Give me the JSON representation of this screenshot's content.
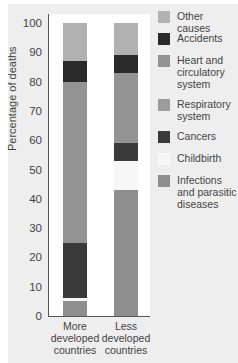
{
  "chart_data": {
    "type": "bar",
    "stacked": true,
    "title": "",
    "ylabel": "Percentage of deaths",
    "xlabel": "",
    "ylim": [
      0,
      100
    ],
    "yticks": [
      0,
      10,
      20,
      30,
      40,
      50,
      60,
      70,
      80,
      90,
      100
    ],
    "categories": [
      "More developed countries",
      "Less developed countries"
    ],
    "category_lines": [
      [
        "More",
        "developed",
        "countries"
      ],
      [
        "Less",
        "developed",
        "countries"
      ]
    ],
    "series": [
      {
        "name": "Infections and parasitic diseases",
        "color": "#8e8e8e",
        "values": [
          5,
          43
        ]
      },
      {
        "name": "Childbirth",
        "color": "#f7f7f7",
        "values": [
          1,
          10
        ]
      },
      {
        "name": "Cancers",
        "color": "#3a3a3a",
        "values": [
          19,
          6
        ]
      },
      {
        "name": "Respiratory system",
        "color": "#9c9c9c",
        "values": [
          0,
          0
        ]
      },
      {
        "name": "Heart and circulatory system",
        "color": "#939393",
        "values": [
          55,
          24
        ]
      },
      {
        "name": "Accidents",
        "color": "#2a2a2a",
        "values": [
          7,
          6
        ]
      },
      {
        "name": "Other causes",
        "color": "#b1b1b1",
        "values": [
          13,
          11
        ]
      }
    ],
    "legend_position": "right",
    "grid": false
  },
  "legend": [
    {
      "label": [
        "Other causes"
      ],
      "color": "#b1b1b1"
    },
    {
      "label": [
        "Accidents"
      ],
      "color": "#2a2a2a"
    },
    {
      "label": [
        "Heart and",
        "circulatory",
        "system"
      ],
      "color": "#939393"
    },
    {
      "label": [
        "Respiratory",
        "system"
      ],
      "color": "#9c9c9c"
    },
    {
      "label": [
        "Cancers"
      ],
      "color": "#3a3a3a"
    },
    {
      "label": [
        "Childbirth"
      ],
      "color": "#f7f7f7"
    },
    {
      "label": [
        "Infections",
        "and parasitic",
        "diseases"
      ],
      "color": "#8e8e8e"
    }
  ]
}
